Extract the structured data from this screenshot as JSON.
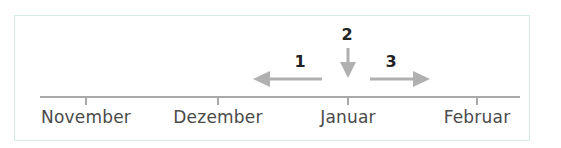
{
  "diagram": {
    "frame_border_color": "#d3ede2",
    "axis_color": "#a9a9a9",
    "arrow_color": "#b0b0b0",
    "months": [
      {
        "label": "November",
        "x": 86
      },
      {
        "label": "Dezember",
        "x": 218
      },
      {
        "label": "Januar",
        "x": 348
      },
      {
        "label": "Februar",
        "x": 477
      }
    ],
    "arrows": [
      {
        "label": "1",
        "direction": "left"
      },
      {
        "label": "2",
        "direction": "down"
      },
      {
        "label": "3",
        "direction": "right"
      }
    ]
  }
}
